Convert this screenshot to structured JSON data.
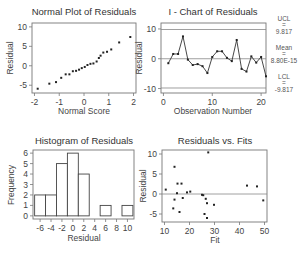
{
  "chart_data": [
    {
      "type": "scatter",
      "title": "Normal Plot of Residuals",
      "xlabel": "Normal Score",
      "ylabel": "Residual",
      "xlim": [
        -2.1,
        2.1
      ],
      "ylim": [
        -7,
        11
      ],
      "xticks": [
        -2,
        -1,
        0,
        1,
        2
      ],
      "yticks": [
        -5,
        0,
        5,
        10
      ],
      "x": [
        -1.87,
        -1.4,
        -1.13,
        -0.92,
        -0.74,
        -0.59,
        -0.45,
        -0.32,
        -0.2,
        -0.09,
        0.03,
        0.14,
        0.26,
        0.38,
        0.51,
        0.6,
        0.67,
        0.78,
        0.93,
        1.1,
        1.42,
        1.87
      ],
      "y": [
        -5.9,
        -4.6,
        -4.2,
        -3.1,
        -2.2,
        -2.2,
        -1.4,
        -1.3,
        -1.0,
        -0.6,
        -0.3,
        0.2,
        0.5,
        0.6,
        1.1,
        2.0,
        2.6,
        3.4,
        3.6,
        4.2,
        6.0,
        7.4
      ]
    },
    {
      "type": "line",
      "title": "I - Chart of Residuals",
      "xlabel": "Observation Number",
      "ylabel": "Residual",
      "xlim": [
        -0.5,
        21
      ],
      "ylim": [
        -11.5,
        12
      ],
      "xticks": [
        0,
        10,
        20
      ],
      "yticks": [
        -10,
        0,
        10
      ],
      "x": [
        1,
        2,
        3,
        4,
        5,
        6,
        7,
        8,
        9,
        10,
        11,
        12,
        13,
        14,
        15,
        16,
        17,
        18,
        19,
        20,
        21
      ],
      "y": [
        -1.5,
        1.6,
        1.6,
        7.5,
        -0.3,
        -2.1,
        -1.8,
        -2.5,
        -4.8,
        0.6,
        2.5,
        2.5,
        0.3,
        -0.8,
        6.3,
        -3.4,
        -4.3,
        0.8,
        -1.3,
        0.6,
        -5.9
      ],
      "ucl": 9.817,
      "mean": 0.0,
      "lcl": -9.817,
      "labels": {
        "ucl_title": "UCL",
        "ucl_eq": "=",
        "ucl_value": "9.817",
        "mean_title": "Mean",
        "mean_eq": "=",
        "mean_value": "8.80E-15",
        "lcl_title": "LCL",
        "lcl_eq": "=",
        "lcl_value": "-9.817"
      }
    },
    {
      "type": "bar",
      "title": "Histogram of Residuals",
      "xlabel": "Residual",
      "ylabel": "Frequency",
      "xticks": [
        -6,
        -4,
        -2,
        0,
        2,
        4,
        6,
        8,
        10
      ],
      "yticks": [
        0,
        1,
        2,
        3,
        4,
        5,
        6
      ],
      "ylim": [
        0,
        6.3
      ],
      "categories": [
        "-6",
        "-4",
        "-2",
        "0",
        "2",
        "4",
        "6",
        "8",
        "10"
      ],
      "values": [
        2,
        2,
        5,
        6,
        4,
        0,
        1,
        0,
        1
      ]
    },
    {
      "type": "scatter",
      "title": "Residuals vs. Fits",
      "xlabel": "Fit",
      "ylabel": "Residual",
      "xlim": [
        9,
        51
      ],
      "ylim": [
        -7,
        11
      ],
      "xticks": [
        10,
        20,
        30,
        40,
        50
      ],
      "yticks": [
        -5,
        0,
        5,
        10
      ],
      "x": [
        10.5,
        14.0,
        13.5,
        14.0,
        15.0,
        15.2,
        16.0,
        16.8,
        17.3,
        19.0,
        20.3,
        25.0,
        25.5,
        26.0,
        26.5,
        27.0,
        27.0,
        27.5,
        29.8,
        43.0,
        47.0,
        49.5
      ],
      "y": [
        1.1,
        6.8,
        -3.6,
        -1.4,
        0.2,
        2.6,
        -4.5,
        2.6,
        -1.0,
        0.4,
        0.6,
        -0.2,
        -0.3,
        -5.0,
        -1.2,
        -2.3,
        -6.0,
        10.4,
        -2.7,
        2.1,
        1.9,
        -1.6
      ],
      "ref_line": 0
    }
  ]
}
